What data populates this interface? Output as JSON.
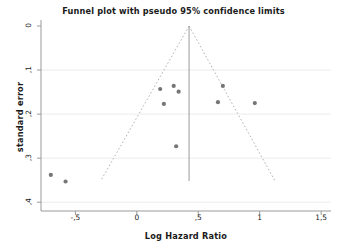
{
  "chart_data": {
    "type": "scatter",
    "title": "Funnel plot with pseudo 95% confidence limits",
    "xlabel": "Log Hazard Ratio",
    "ylabel": "standard error",
    "xlim": [
      -0.78,
      1.58
    ],
    "ylim": [
      0,
      0.42
    ],
    "y_axis_inverted": true,
    "grid": "horizontal",
    "legend": "none",
    "x_ticks": [
      {
        "value": -0.5,
        "label": "-,5"
      },
      {
        "value": 0,
        "label": "0"
      },
      {
        "value": 0.5,
        "label": ",5"
      },
      {
        "value": 1,
        "label": "1"
      },
      {
        "value": 1.5,
        "label": "1,5"
      }
    ],
    "y_ticks": [
      {
        "value": 0,
        "label": "0"
      },
      {
        "value": 0.1,
        "label": ",1"
      },
      {
        "value": 0.2,
        "label": ",2"
      },
      {
        "value": 0.3,
        "label": ",3"
      },
      {
        "value": 0.4,
        "label": ",4"
      }
    ],
    "series": [
      {
        "name": "studies",
        "marker": "circle",
        "color": "#767676",
        "points": [
          {
            "x": 0.19,
            "y": 0.143
          },
          {
            "x": 0.3,
            "y": 0.136
          },
          {
            "x": 0.34,
            "y": 0.149
          },
          {
            "x": 0.22,
            "y": 0.177
          },
          {
            "x": 0.7,
            "y": 0.136
          },
          {
            "x": 0.66,
            "y": 0.173
          },
          {
            "x": 0.96,
            "y": 0.175
          },
          {
            "x": 0.32,
            "y": 0.273
          },
          {
            "x": -0.7,
            "y": 0.338
          },
          {
            "x": -0.58,
            "y": 0.353
          }
        ]
      }
    ],
    "reference_line": {
      "name": "pooled effect",
      "x": 0.425,
      "y_from": 0,
      "y_to": 0.352,
      "color": "#9a9a9a",
      "style": "solid"
    },
    "confidence_limits": {
      "name": "pseudo 95% confidence limits",
      "apex": {
        "x": 0.425,
        "y": 0
      },
      "left_end": {
        "x": -0.295,
        "y": 0.352
      },
      "right_end": {
        "x": 1.125,
        "y": 0.352
      },
      "color": "#b4b4b4",
      "style": "dashed"
    }
  },
  "axes": {
    "frame_color": "#9a9a9a",
    "grid_color": "#ececec"
  }
}
